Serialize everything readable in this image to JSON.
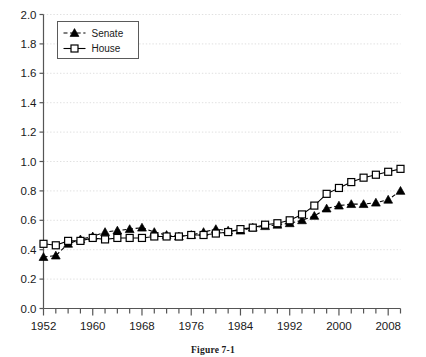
{
  "caption": "Figure 7-1",
  "legend": {
    "position": "top-left-inside",
    "entries": [
      {
        "label": "Senate",
        "marker": "filled-triangle",
        "line": "dashed",
        "color": "#000000"
      },
      {
        "label": "House",
        "marker": "open-square",
        "line": "solid",
        "color": "#000000"
      }
    ]
  },
  "axes": {
    "y_ticks": [
      "0.0",
      "0.2",
      "0.4",
      "0.6",
      "0.8",
      "1.0",
      "1.2",
      "1.4",
      "1.6",
      "1.8",
      "2.0"
    ],
    "x_ticks_labeled": [
      "1952",
      "1960",
      "1968",
      "1976",
      "1984",
      "1992",
      "2000",
      "2008"
    ],
    "x_tick_interval_years": 2,
    "grid": "dotted-horizontal"
  },
  "chart_data": {
    "type": "line",
    "title": "",
    "xlabel": "",
    "ylabel": "",
    "xlim": [
      1952,
      2010
    ],
    "ylim": [
      0.0,
      2.0
    ],
    "grid": true,
    "legend_position": "upper left",
    "x": [
      1952,
      1954,
      1956,
      1958,
      1960,
      1962,
      1964,
      1966,
      1968,
      1970,
      1972,
      1974,
      1976,
      1978,
      1980,
      1982,
      1984,
      1986,
      1988,
      1990,
      1992,
      1994,
      1996,
      1998,
      2000,
      2002,
      2004,
      2006,
      2008,
      2010
    ],
    "series": [
      {
        "name": "Senate",
        "marker": "filled-triangle",
        "linestyle": "dashed",
        "values": [
          0.35,
          0.36,
          0.44,
          0.47,
          0.49,
          0.52,
          0.53,
          0.54,
          0.55,
          0.52,
          0.5,
          0.49,
          0.5,
          0.52,
          0.54,
          0.53,
          0.53,
          0.55,
          0.56,
          0.57,
          0.58,
          0.6,
          0.63,
          0.68,
          0.7,
          0.71,
          0.71,
          0.72,
          0.74,
          0.8
        ]
      },
      {
        "name": "House",
        "marker": "open-square",
        "linestyle": "solid",
        "values": [
          0.44,
          0.43,
          0.46,
          0.46,
          0.48,
          0.47,
          0.48,
          0.48,
          0.48,
          0.49,
          0.49,
          0.49,
          0.5,
          0.5,
          0.51,
          0.52,
          0.54,
          0.55,
          0.57,
          0.58,
          0.6,
          0.64,
          0.7,
          0.78,
          0.82,
          0.86,
          0.89,
          0.91,
          0.93,
          0.95
        ]
      }
    ]
  },
  "colors": {
    "axis": "#555555",
    "grid": "#d8d8d8",
    "ink": "#000000",
    "background": "#ffffff"
  }
}
